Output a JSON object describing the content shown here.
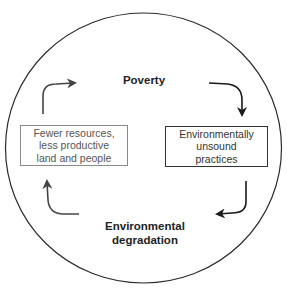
{
  "diagram": {
    "type": "cycle",
    "nodes": [
      {
        "id": "poverty",
        "label": "Poverty",
        "style": "bold-text",
        "position": "top"
      },
      {
        "id": "unsound",
        "label": "Environmentally\nunsound\npractices",
        "style": "boxed",
        "position": "right"
      },
      {
        "id": "degradation",
        "label": "Environmental\ndegradation",
        "style": "bold-text",
        "position": "bottom"
      },
      {
        "id": "fewer",
        "label": "Fewer resources,\nless productive\nland and people",
        "style": "boxed-light",
        "position": "left"
      }
    ],
    "edges": [
      {
        "from": "poverty",
        "to": "unsound"
      },
      {
        "from": "unsound",
        "to": "degradation"
      },
      {
        "from": "degradation",
        "to": "fewer"
      },
      {
        "from": "fewer",
        "to": "poverty"
      }
    ],
    "colors": {
      "circle": "#2a2a2a",
      "arrow_dark": "#1a1a1a",
      "arrow_gray": "#444444",
      "box_left_border": "#8a8a8a",
      "box_right_border": "#333333"
    }
  }
}
